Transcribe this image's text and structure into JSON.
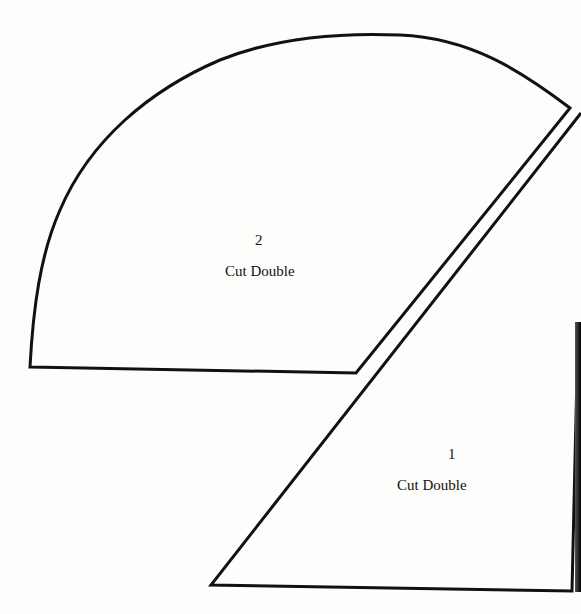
{
  "page": {
    "background": "#fdfdfc",
    "line_color": "#111111"
  },
  "pieces": [
    {
      "id": "piece-2",
      "number": "2",
      "instruction": "Cut Double"
    },
    {
      "id": "piece-1",
      "number": "1",
      "instruction": "Cut Double"
    }
  ]
}
